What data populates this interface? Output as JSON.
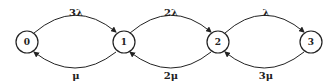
{
  "diagram": {
    "type": "state-transition (birth-death chain)",
    "nodes": [
      {
        "id": "0",
        "label": "0",
        "cx": 27,
        "cy": 42
      },
      {
        "id": "1",
        "label": "1",
        "cx": 124,
        "cy": 42
      },
      {
        "id": "2",
        "label": "2",
        "cx": 218,
        "cy": 42
      },
      {
        "id": "3",
        "label": "3",
        "cx": 311,
        "cy": 42
      }
    ],
    "edges": [
      {
        "from": "0",
        "to": "1",
        "label": "3λ",
        "direction": "forward"
      },
      {
        "from": "1",
        "to": "2",
        "label": "2λ",
        "direction": "forward"
      },
      {
        "from": "2",
        "to": "3",
        "label": "λ",
        "direction": "forward"
      },
      {
        "from": "1",
        "to": "0",
        "label": "μ",
        "direction": "backward"
      },
      {
        "from": "2",
        "to": "1",
        "label": "2μ",
        "direction": "backward"
      },
      {
        "from": "3",
        "to": "2",
        "label": "3μ",
        "direction": "backward"
      }
    ],
    "stroke_color": "#222222"
  }
}
